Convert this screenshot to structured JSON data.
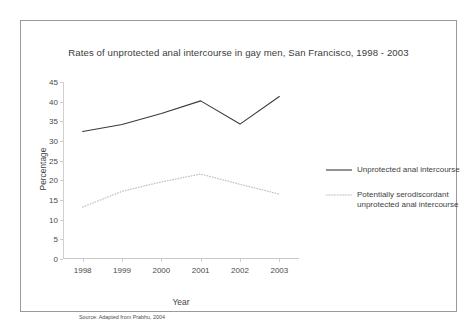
{
  "figure": {
    "title": "Rates of unprotected anal intercourse in gay men, San Francisco, 1998 - 2003",
    "source_note": "Source: Adapted from Prabhu, 2004"
  },
  "chart_data": {
    "type": "line",
    "title": "Rates of unprotected anal intercourse in gay men, San Francisco, 1998 - 2003",
    "xlabel": "Year",
    "ylabel": "Percentage",
    "categories": [
      "1998",
      "1999",
      "2000",
      "2001",
      "2002",
      "2003"
    ],
    "x": [
      1998,
      1999,
      2000,
      2001,
      2002,
      2003
    ],
    "ylim": [
      0,
      45
    ],
    "yticks": [
      0,
      5,
      10,
      15,
      20,
      25,
      30,
      35,
      40,
      45
    ],
    "grid": false,
    "legend_position": "right",
    "series": [
      {
        "name": "Unprotected anal intercourse",
        "style": "solid",
        "color": "#3a3a3a",
        "values": [
          32.4,
          34.2,
          37.0,
          40.2,
          34.3,
          41.3
        ]
      },
      {
        "name": "Potentially serodiscordant unprotected anal intercourse",
        "style": "dotted",
        "color": "#c2c2c2",
        "values": [
          13.2,
          17.2,
          19.6,
          21.6,
          19.0,
          16.5
        ]
      }
    ]
  },
  "legend": {
    "items": [
      {
        "label_line1": "Unprotected anal intercourse",
        "label_line2": ""
      },
      {
        "label_line1": "Potentially serodiscordant",
        "label_line2": "unprotected anal intercourse"
      }
    ]
  },
  "axis": {
    "y_ticks": [
      "45",
      "40",
      "35",
      "30",
      "25",
      "20",
      "15",
      "10",
      "5",
      "0"
    ],
    "x_ticks": [
      "1998",
      "1999",
      "2000",
      "2001",
      "2002",
      "2003"
    ],
    "y_title": "Percentage",
    "x_title": "Year"
  }
}
